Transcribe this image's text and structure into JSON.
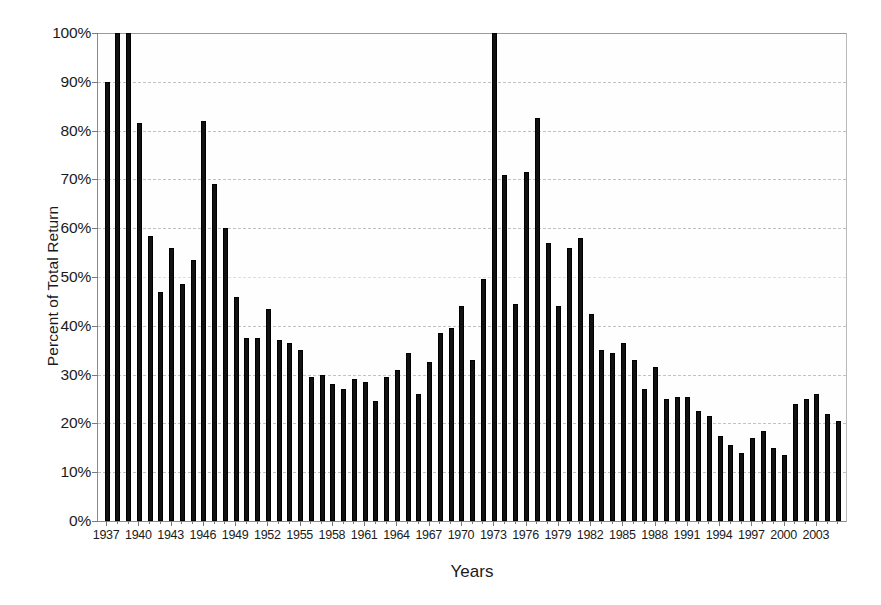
{
  "chart_data": {
    "type": "bar",
    "title": "",
    "xlabel": "Years",
    "ylabel": "Percent of  Total Return",
    "ylim": [
      0,
      100
    ],
    "yunit": "%",
    "ytick_labels": [
      "0%",
      "10%",
      "20%",
      "30%",
      "40%",
      "50%",
      "60%",
      "70%",
      "80%",
      "90%",
      "100%"
    ],
    "ytick_values": [
      0,
      10,
      20,
      30,
      40,
      50,
      60,
      70,
      80,
      90,
      100
    ],
    "grid": "horizontal-dashed",
    "legend": "none",
    "bar_color": "#111111",
    "xtick_step": 3,
    "xtick_labels": [
      "1937",
      "1940",
      "1943",
      "1946",
      "1949",
      "1952",
      "1955",
      "1958",
      "1961",
      "1964",
      "1967",
      "1970",
      "1973",
      "1976",
      "1979",
      "1982",
      "1985",
      "1988",
      "1991",
      "1994",
      "1997",
      "2000",
      "2003"
    ],
    "categories": [
      1937,
      1938,
      1939,
      1940,
      1941,
      1942,
      1943,
      1944,
      1945,
      1946,
      1947,
      1948,
      1949,
      1950,
      1951,
      1952,
      1953,
      1954,
      1955,
      1956,
      1957,
      1958,
      1959,
      1960,
      1961,
      1962,
      1963,
      1964,
      1965,
      1966,
      1967,
      1968,
      1969,
      1970,
      1971,
      1972,
      1973,
      1974,
      1975,
      1976,
      1977,
      1978,
      1979,
      1980,
      1981,
      1982,
      1983,
      1984,
      1985,
      1986,
      1987,
      1988,
      1989,
      1990,
      1991,
      1992,
      1993,
      1994,
      1995,
      1996,
      1997,
      1998,
      1999,
      2000,
      2001,
      2002,
      2003,
      2004,
      2005
    ],
    "values": [
      90.0,
      100.0,
      100.0,
      81.5,
      58.5,
      47.0,
      56.0,
      48.5,
      53.5,
      82.0,
      69.0,
      60.0,
      46.0,
      37.5,
      37.5,
      43.5,
      37.0,
      36.5,
      35.0,
      29.5,
      30.0,
      28.0,
      27.0,
      29.0,
      28.5,
      24.5,
      29.5,
      31.0,
      34.5,
      26.0,
      32.5,
      38.5,
      39.5,
      44.0,
      33.0,
      49.5,
      100.0,
      71.0,
      44.5,
      71.5,
      82.5,
      57.0,
      44.0,
      56.0,
      58.0,
      42.5,
      35.0,
      34.5,
      36.5,
      33.0,
      27.0,
      31.5,
      25.0,
      25.5,
      25.5,
      22.5,
      21.5,
      17.5,
      15.5,
      14.0,
      17.0,
      18.5,
      15.0,
      13.5,
      24.0,
      25.0,
      26.0,
      22.0,
      20.5
    ]
  }
}
